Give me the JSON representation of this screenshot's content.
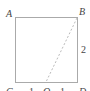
{
  "diagram": {
    "type": "geometry-square",
    "vertices": {
      "A": "A",
      "B": "B",
      "C": "C",
      "D": "D",
      "O": "O"
    },
    "side_labels": {
      "right": "2",
      "bottom_left": "1",
      "bottom_right": "1"
    },
    "segments": [
      {
        "from": "A",
        "to": "B",
        "style": "solid"
      },
      {
        "from": "B",
        "to": "D",
        "style": "solid"
      },
      {
        "from": "D",
        "to": "C",
        "style": "solid"
      },
      {
        "from": "C",
        "to": "A",
        "style": "solid"
      },
      {
        "from": "B",
        "to": "O",
        "style": "dashed"
      }
    ],
    "colors": {
      "line": "#aaaaaa",
      "text": "#444444"
    }
  }
}
